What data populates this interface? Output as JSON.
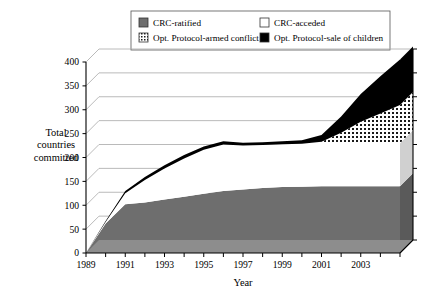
{
  "chart_data": {
    "type": "area",
    "title": "",
    "subtitle": "",
    "xlabel": "Year",
    "ylabel": "Total countries committed",
    "ylabel_lines": [
      "Total",
      "countries",
      "committed"
    ],
    "stacked": true,
    "three_d": true,
    "grid": true,
    "legend_position": "top",
    "xlim": [
      1989,
      2005
    ],
    "ylim": [
      0,
      400
    ],
    "ytick_step": 50,
    "yticks": [
      0,
      50,
      100,
      150,
      200,
      250,
      300,
      350,
      400
    ],
    "ytick_labels": [
      "0",
      "50",
      "100",
      "150",
      "200",
      "250",
      "300",
      "350",
      "400"
    ],
    "xticks": [
      1989,
      1990,
      1991,
      1992,
      1993,
      1994,
      1995,
      1996,
      1997,
      1998,
      1999,
      2000,
      2001,
      2002,
      2003,
      2004,
      2005
    ],
    "xtick_labels_shown": [
      "1989",
      "1991",
      "1993",
      "1995",
      "1997",
      "1999",
      "2001",
      "2003"
    ],
    "xtick_label_step": 2,
    "x": [
      1989,
      1990,
      1991,
      1992,
      1993,
      1994,
      1995,
      1996,
      1997,
      1998,
      1999,
      2000,
      2001,
      2002,
      2003,
      2004,
      2005
    ],
    "series": [
      {
        "name": "CRC-ratified",
        "key": "crc_ratified",
        "fill": "#6e6e6e",
        "pattern": "solid",
        "values": [
          0,
          62,
          102,
          106,
          112,
          118,
          124,
          130,
          133,
          136,
          138,
          139,
          140,
          140,
          140,
          140,
          140
        ]
      },
      {
        "name": "CRC-acceded",
        "key": "crc_acceded",
        "fill": "#ffffff",
        "pattern": "solid",
        "values": [
          0,
          3,
          23,
          47,
          65,
          80,
          92,
          97,
          92,
          90,
          90,
          90,
          90,
          90,
          90,
          90,
          90
        ]
      },
      {
        "name": "Opt. Protocol-armed conflict",
        "key": "op_armed_conflict",
        "fill": "#ffffff",
        "pattern": "dotted",
        "values": [
          0,
          0,
          0,
          0,
          0,
          0,
          0,
          0,
          0,
          0,
          0,
          0,
          3,
          22,
          45,
          62,
          80
        ]
      },
      {
        "name": "Opt. Protocol-sale of children",
        "key": "op_sale_of_children",
        "fill": "#000000",
        "pattern": "solid",
        "values": [
          0,
          2,
          5,
          6,
          7,
          7,
          7,
          7,
          6,
          6,
          6,
          7,
          14,
          34,
          58,
          78,
          95
        ]
      }
    ],
    "totals": [
      0,
      67,
      130,
      159,
      184,
      205,
      223,
      234,
      231,
      232,
      234,
      236,
      247,
      286,
      333,
      370,
      405
    ]
  },
  "legend": {
    "items": [
      {
        "label": "CRC-ratified",
        "swatch": "solid-gray"
      },
      {
        "label": "CRC-acceded",
        "swatch": "empty-white"
      },
      {
        "label": "Opt. Protocol-armed conflict",
        "swatch": "dotted"
      },
      {
        "label": "Opt. Protocol-sale of children",
        "swatch": "solid-black"
      }
    ]
  },
  "colors": {
    "ratified_gray": "#6e6e6e",
    "acceded_white": "#ffffff",
    "sale_black": "#000000",
    "axis": "#000000",
    "grid": "#a8a8a8",
    "side_wall": "#5a5a5a"
  }
}
